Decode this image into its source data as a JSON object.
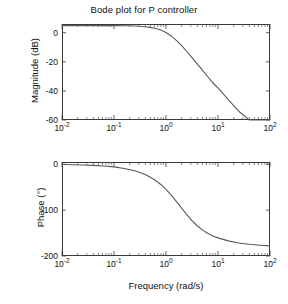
{
  "figure": {
    "title": "Bode plot for P controller",
    "background": "#ffffff",
    "curve_color": "#555a5e",
    "axis_color": "#3a3a3a"
  },
  "chart_data": [
    {
      "type": "line",
      "name": "magnitude",
      "title": "Bode plot for P controller",
      "xlabel": "",
      "ylabel": "Magnitude (dB)",
      "xscale": "log",
      "xlim": [
        0.01,
        100
      ],
      "ylim": [
        -60,
        6
      ],
      "xtick_labels": [
        "10-2",
        "10-1",
        "100",
        "101",
        "102"
      ],
      "xtick_exponents": [
        "-2",
        "-1",
        "0",
        "1",
        "2"
      ],
      "xtick_values": [
        0.01,
        0.1,
        1,
        10,
        100
      ],
      "ytick_labels": [
        "0",
        "-20",
        "-40",
        "-60"
      ],
      "ytick_values": [
        0,
        -20,
        -40,
        -60
      ],
      "grid": false,
      "legend": null,
      "x": [
        0.01,
        0.0158,
        0.0251,
        0.0398,
        0.0631,
        0.1,
        0.158,
        0.251,
        0.316,
        0.398,
        0.501,
        0.631,
        0.794,
        1.0,
        1.26,
        1.58,
        2.0,
        2.51,
        3.16,
        3.98,
        5.01,
        6.31,
        7.94,
        10.0,
        15.8,
        25.1,
        39.8,
        63.1,
        100.0
      ],
      "y": [
        4.9,
        4.9,
        4.9,
        4.9,
        4.88,
        4.85,
        4.78,
        4.6,
        4.42,
        4.1,
        3.66,
        2.95,
        1.85,
        0.2,
        -2.2,
        -5.3,
        -8.9,
        -12.9,
        -17.1,
        -21.4,
        -25.7,
        -30.1,
        -34.4,
        -38.0,
        -46.0,
        -54.0,
        -62.0,
        -70.0,
        -60.2
      ]
    },
    {
      "type": "line",
      "name": "phase",
      "title": "",
      "xlabel": "Frequency (rad/s)",
      "ylabel": "Phase (°)",
      "xscale": "log",
      "xlim": [
        0.01,
        100
      ],
      "ylim": [
        -200,
        5
      ],
      "xtick_labels": [
        "10-2",
        "10-1",
        "100",
        "101",
        "102"
      ],
      "xtick_exponents": [
        "-2",
        "-1",
        "0",
        "1",
        "2"
      ],
      "xtick_values": [
        0.01,
        0.1,
        1,
        10,
        100
      ],
      "ytick_labels": [
        "0",
        "-100",
        "-200"
      ],
      "ytick_values": [
        0,
        -100,
        -200
      ],
      "grid": false,
      "legend": null,
      "x": [
        0.01,
        0.0158,
        0.0251,
        0.0398,
        0.0631,
        0.1,
        0.158,
        0.251,
        0.316,
        0.398,
        0.501,
        0.631,
        0.794,
        1.0,
        1.26,
        1.58,
        2.0,
        2.51,
        3.16,
        3.98,
        5.01,
        6.31,
        7.94,
        10.0,
        15.8,
        25.1,
        39.8,
        63.1,
        100.0
      ],
      "y": [
        -0.6,
        -0.9,
        -1.4,
        -2.3,
        -3.6,
        -5.7,
        -9.0,
        -14.2,
        -17.9,
        -22.5,
        -28.2,
        -35.3,
        -44.0,
        -54.5,
        -67.0,
        -81.0,
        -95.5,
        -110.0,
        -123.0,
        -134.0,
        -143.0,
        -150.5,
        -156.5,
        -160.5,
        -167.0,
        -171.5,
        -174.5,
        -176.5,
        -178.0
      ]
    }
  ],
  "axes": {
    "magnitude": {
      "ylabel": "Magnitude (dB)",
      "yticks": [
        "0",
        "-20",
        "-40",
        "-60"
      ],
      "xticks": [
        {
          "mantissa": "10",
          "exp": "-2"
        },
        {
          "mantissa": "10",
          "exp": "-1"
        },
        {
          "mantissa": "10",
          "exp": "0"
        },
        {
          "mantissa": "10",
          "exp": "1"
        },
        {
          "mantissa": "10",
          "exp": "2"
        }
      ]
    },
    "phase": {
      "ylabel": "Phase (°)",
      "xlabel": "Frequency (rad/s)",
      "yticks": [
        "0",
        "-100",
        "-200"
      ],
      "xticks": [
        {
          "mantissa": "10",
          "exp": "-2"
        },
        {
          "mantissa": "10",
          "exp": "-1"
        },
        {
          "mantissa": "10",
          "exp": "0"
        },
        {
          "mantissa": "10",
          "exp": "1"
        },
        {
          "mantissa": "10",
          "exp": "2"
        }
      ]
    }
  }
}
